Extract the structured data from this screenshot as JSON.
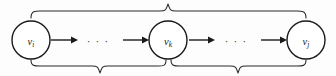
{
  "figure": {
    "type": "graph-path-diagram",
    "canvas": {
      "width": 336,
      "height": 76,
      "background": "#fdfdfd"
    },
    "colors": {
      "stroke": "#1a1a1a",
      "brace": "#2b2b2b",
      "node_fill": "#ffffff"
    },
    "nodes": [
      {
        "id": "node-vi",
        "base": "v",
        "subscript": "i",
        "cx": 31,
        "cy": 40,
        "r": 19
      },
      {
        "id": "node-vk",
        "base": "v",
        "subscript": "k",
        "cx": 168,
        "cy": 40,
        "r": 19
      },
      {
        "id": "node-vj",
        "base": "v",
        "subscript": "j",
        "cx": 306,
        "cy": 40,
        "r": 19
      }
    ],
    "ellipses": [
      {
        "id": "ellipsis-left",
        "text": "· · ·",
        "cx": 98,
        "cy": 40
      },
      {
        "id": "ellipsis-right",
        "text": "· · ·",
        "cx": 236,
        "cy": 40
      }
    ],
    "arrows": [
      {
        "id": "arrow-vi-out",
        "x1": 51,
        "y1": 40,
        "x2": 76,
        "y2": 40
      },
      {
        "id": "arrow-vk-in",
        "x1": 123,
        "y1": 40,
        "x2": 148,
        "y2": 40
      },
      {
        "id": "arrow-vk-out",
        "x1": 189,
        "y1": 40,
        "x2": 214,
        "y2": 40
      },
      {
        "id": "arrow-vj-in",
        "x1": 261,
        "y1": 40,
        "x2": 286,
        "y2": 40
      }
    ],
    "braces": [
      {
        "id": "brace-top-full",
        "orientation": "top",
        "from_node": "node-vi",
        "to_node": "node-vj",
        "x_start": 31,
        "x_end": 306,
        "x_peak": 168,
        "y_base": 18,
        "y_tip": 4,
        "label": ""
      },
      {
        "id": "brace-bottom-left",
        "orientation": "bottom",
        "from_node": "node-vi",
        "to_node": "node-vk",
        "x_start": 31,
        "x_end": 166,
        "x_peak": 100,
        "y_base": 60,
        "y_tip": 73,
        "label": ""
      },
      {
        "id": "brace-bottom-right",
        "orientation": "bottom",
        "from_node": "node-vk",
        "to_node": "node-vj",
        "x_start": 171,
        "x_end": 306,
        "x_peak": 238,
        "y_base": 60,
        "y_tip": 73,
        "label": ""
      }
    ]
  }
}
